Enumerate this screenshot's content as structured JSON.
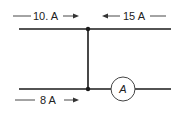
{
  "diagram": {
    "type": "circuit-junction",
    "colors": {
      "wire": "#1a1a1a",
      "text": "#222222",
      "background": "#ffffff"
    },
    "currents": [
      {
        "id": "top-left",
        "label": "10. A",
        "direction": "right",
        "wire": "top"
      },
      {
        "id": "top-right",
        "label": "15 A",
        "direction": "left",
        "wire": "top"
      },
      {
        "id": "bottom-left",
        "label": "8 A",
        "direction": "right",
        "wire": "bottom"
      }
    ],
    "ammeter": {
      "symbol": "A",
      "wire": "bottom",
      "position": "right of junction"
    },
    "junctions": 2
  }
}
